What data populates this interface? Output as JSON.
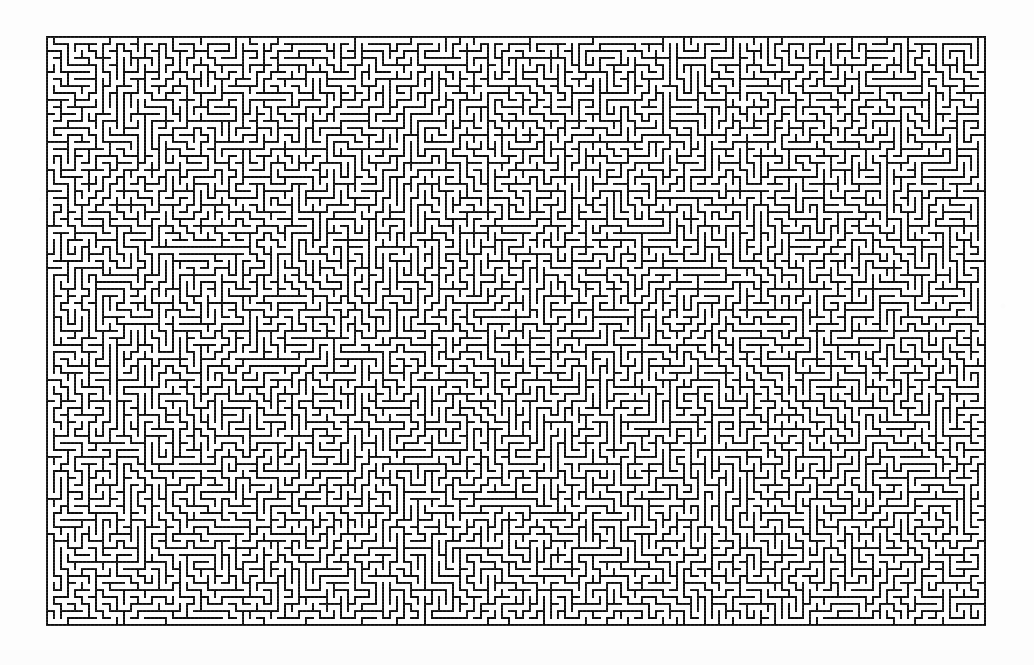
{
  "page": {
    "background_color": "#fefefe",
    "width": 1034,
    "height": 665
  },
  "maze": {
    "name": "rectangular-perfect-maze",
    "wall_color": "#0d0d0d",
    "passage_color": "#ffffff",
    "x": 47,
    "y": 37,
    "width": 936,
    "height": 584,
    "cell_size": 7,
    "wall_thickness": 2,
    "columns": 134,
    "rows": 84,
    "border_closed": true,
    "entrance": "",
    "exit": "",
    "seed": 20240617
  }
}
